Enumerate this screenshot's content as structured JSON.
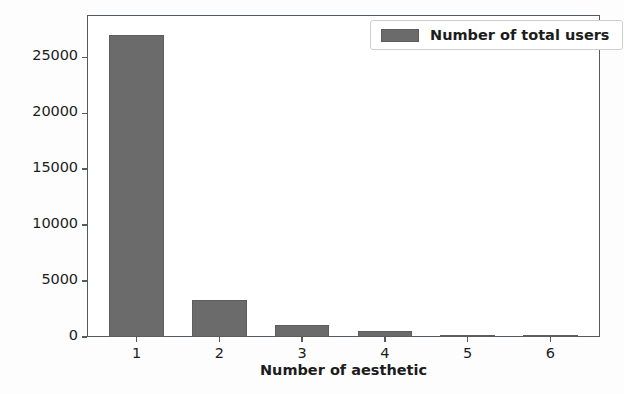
{
  "chart_data": {
    "type": "bar",
    "title": "",
    "xlabel": "Number of aesthetic",
    "ylabel": "",
    "categories": [
      "1",
      "2",
      "3",
      "4",
      "5",
      "6"
    ],
    "values": [
      27000,
      3300,
      1100,
      500,
      150,
      120
    ],
    "series": [
      {
        "name": "Number of total users",
        "values": [
          27000,
          3300,
          1100,
          500,
          150,
          120
        ],
        "color": "#6b6b6b"
      }
    ],
    "ylim": [
      0,
      28800
    ],
    "xlim": [
      0.4,
      6.6
    ],
    "yticks": [
      0,
      5000,
      10000,
      15000,
      20000,
      25000
    ],
    "ytick_labels": [
      "0",
      "5000",
      "10000",
      "15000",
      "20000",
      "25000"
    ],
    "xticks": [
      1,
      2,
      3,
      4,
      5,
      6
    ],
    "xtick_labels": [
      "1",
      "2",
      "3",
      "4",
      "5",
      "6"
    ],
    "grid": false,
    "legend_position": "upper right",
    "legend_entries": [
      "Number of total users"
    ]
  },
  "figure": {
    "background_color": "#ffffff",
    "axes_color": "#555a5e",
    "bar_color": "#6b6b6b",
    "text_color": "#1c1c1c"
  },
  "legend": {
    "label": "Number of total users",
    "swatch_name": "legend-color-swatch"
  }
}
